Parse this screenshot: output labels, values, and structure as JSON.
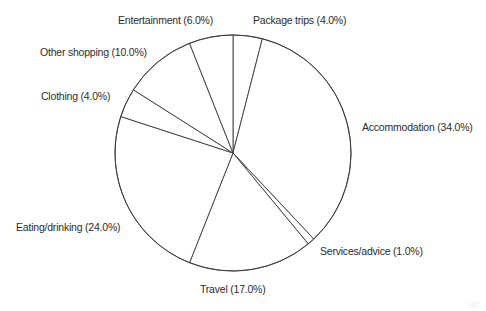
{
  "chart_data": {
    "type": "pie",
    "title": "",
    "subtitle": "",
    "xlabel": "",
    "ylabel": "",
    "grid": false,
    "legend_position": "none",
    "label_format": "{name} ({value}%)",
    "start_angle_deg": 90,
    "direction": "clockwise",
    "units": "percent",
    "total": 100.0,
    "categories": [
      "Package trips",
      "Accommodation",
      "Services/advice",
      "Travel",
      "Eating/drinking",
      "Clothing",
      "Other shopping",
      "Entertainment"
    ],
    "values": [
      4.0,
      34.0,
      1.0,
      17.0,
      24.0,
      4.0,
      10.0,
      6.0
    ],
    "slices": [
      {
        "name": "Package trips",
        "value": 4.0,
        "label": "Package trips (4.0%)",
        "color": "#ffffff",
        "edge_color": "#3a3a3a",
        "label_x": 253,
        "label_y": 15,
        "label_align": "start"
      },
      {
        "name": "Accommodation",
        "value": 34.0,
        "label": "Accommodation (34.0%)",
        "color": "#ffffff",
        "edge_color": "#3a3a3a",
        "label_x": 362,
        "label_y": 122,
        "label_align": "start"
      },
      {
        "name": "Services/advice",
        "value": 1.0,
        "label": "Services/advice (1.0%)",
        "color": "#ffffff",
        "edge_color": "#3a3a3a",
        "label_x": 320,
        "label_y": 246,
        "label_align": "start"
      },
      {
        "name": "Travel",
        "value": 17.0,
        "label": "Travel (17.0%)",
        "color": "#ffffff",
        "edge_color": "#3a3a3a",
        "label_x": 200,
        "label_y": 284,
        "label_align": "start"
      },
      {
        "name": "Eating/drinking",
        "value": 24.0,
        "label": "Eating/drinking (24.0%)",
        "color": "#ffffff",
        "edge_color": "#3a3a3a",
        "label_x": 16,
        "label_y": 222,
        "label_align": "start"
      },
      {
        "name": "Clothing",
        "value": 4.0,
        "label": "Clothing (4.0%)",
        "color": "#ffffff",
        "edge_color": "#3a3a3a",
        "label_x": 41,
        "label_y": 91,
        "label_align": "start"
      },
      {
        "name": "Other shopping",
        "value": 10.0,
        "label": "Other shopping (10.0%)",
        "color": "#ffffff",
        "edge_color": "#3a3a3a",
        "label_x": 40,
        "label_y": 47,
        "label_align": "start"
      },
      {
        "name": "Entertainment",
        "value": 6.0,
        "label": "Entertainment (6.0%)",
        "color": "#ffffff",
        "edge_color": "#3a3a3a",
        "label_x": 118,
        "label_y": 15,
        "label_align": "start"
      }
    ],
    "geometry": {
      "center_x": 233,
      "center_y": 153,
      "radius": 118
    },
    "style": {
      "background": "#ffffff",
      "line_color": "#3a3a3a",
      "text_color": "#2b2b2b"
    }
  }
}
